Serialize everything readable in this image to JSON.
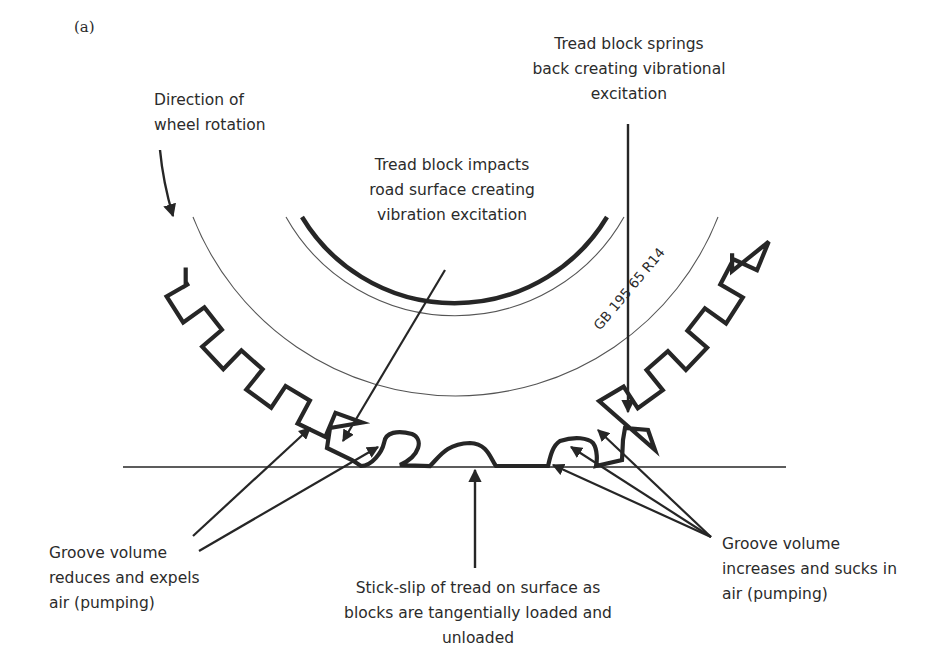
{
  "figure": {
    "panel_label": "(a)",
    "tire_marking": "GB 195 65 R14"
  },
  "labels": {
    "direction": {
      "lines": [
        "Direction of",
        "wheel rotation"
      ]
    },
    "impact": {
      "lines": [
        "Tread block impacts",
        "road surface creating",
        "vibration excitation"
      ]
    },
    "springs_back": {
      "lines": [
        "Tread block springs",
        "back creating vibrational",
        "excitation"
      ]
    },
    "groove_reduces": {
      "lines": [
        "Groove volume",
        "reduces and expels",
        "air (pumping)"
      ]
    },
    "stick_slip": {
      "lines": [
        "Stick-slip of tread on surface as",
        "blocks are tangentially loaded and",
        "unloaded"
      ]
    },
    "groove_increases": {
      "lines": [
        "Groove volume",
        "increases and sucks in",
        "air (pumping)"
      ]
    }
  },
  "colors": {
    "ink": "#262626",
    "thin_line": "#555555",
    "background": "#ffffff"
  }
}
